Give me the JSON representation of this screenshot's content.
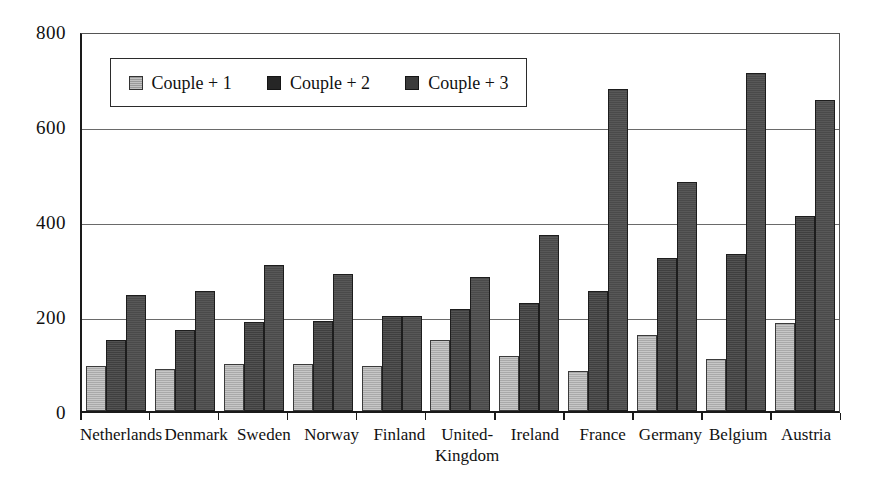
{
  "chart_data": {
    "type": "bar",
    "title": "",
    "xlabel": "",
    "ylabel": "",
    "ylim": [
      0,
      800
    ],
    "ytick_values": [
      0,
      200,
      400,
      600,
      800
    ],
    "ytick_labels": [
      "0",
      "200",
      "400",
      "600",
      "800"
    ],
    "grid": true,
    "legend_position": "upper-left-inside",
    "categories": [
      "Netherlands",
      "Denmark",
      "Sweden",
      "Norway",
      "Finland",
      "United-\nKingdom",
      "Ireland",
      "France",
      "Germany",
      "Belgium",
      "Austria"
    ],
    "series": [
      {
        "name": "Couple + 1",
        "color": "#a9a9a9",
        "values": [
          95,
          88,
          98,
          98,
          95,
          150,
          115,
          85,
          160,
          110,
          185
        ]
      },
      {
        "name": "Couple + 2",
        "color": "#3f3f3f",
        "values": [
          150,
          170,
          188,
          190,
          200,
          215,
          228,
          253,
          323,
          330,
          410
        ]
      },
      {
        "name": "Couple + 3",
        "color": "#4a4a4a",
        "values": [
          245,
          253,
          307,
          288,
          200,
          283,
          370,
          678,
          483,
          712,
          655
        ]
      }
    ]
  },
  "legend": {
    "items": [
      {
        "label": "Couple + 1"
      },
      {
        "label": "Couple + 2"
      },
      {
        "label": "Couple + 3"
      }
    ]
  }
}
